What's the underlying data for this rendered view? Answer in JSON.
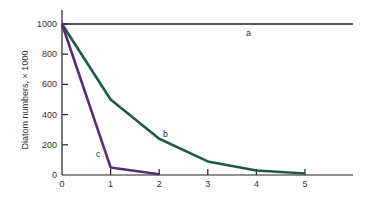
{
  "chart_data": {
    "type": "line",
    "title": "",
    "xlabel": "",
    "ylabel": "Diatom numbers, × 1000",
    "xlim": [
      0,
      6
    ],
    "ylim": [
      0,
      1100
    ],
    "x_ticks": [
      "0",
      "1",
      "2",
      "3",
      "4",
      "5"
    ],
    "y_ticks": [
      "0",
      "200",
      "400",
      "600",
      "800",
      "1000"
    ],
    "grid": false,
    "legend": "inline labels",
    "series": [
      {
        "name": "a",
        "color": "#222222",
        "x": [
          0,
          6
        ],
        "values": [
          1000,
          1000
        ]
      },
      {
        "name": "b",
        "color": "#1f5a48",
        "x": [
          0,
          1,
          2,
          3,
          4,
          5
        ],
        "values": [
          1000,
          500,
          240,
          90,
          30,
          10
        ]
      },
      {
        "name": "c",
        "color": "#5a2d6e",
        "x": [
          0,
          1,
          2
        ],
        "values": [
          1000,
          50,
          5
        ]
      }
    ]
  }
}
